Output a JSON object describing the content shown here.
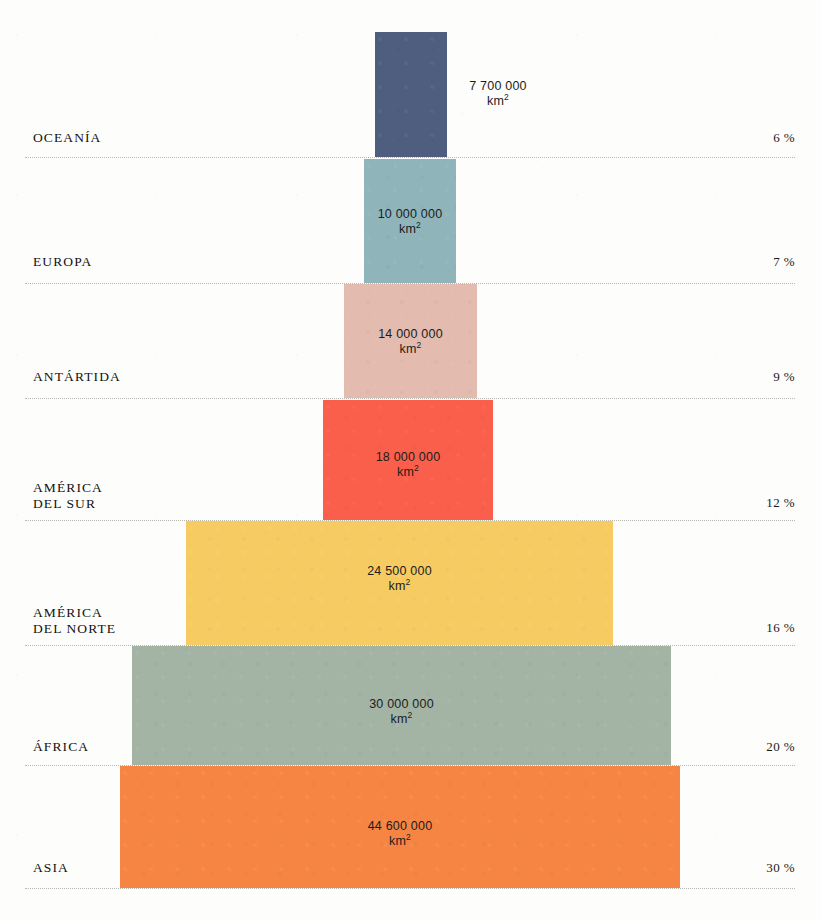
{
  "chart_data": {
    "type": "bar",
    "title": "",
    "subtitle": "",
    "xlabel": "",
    "ylabel": "",
    "orientation": "horizontal-centered-pyramid",
    "unit": "km²",
    "legend_position": "none",
    "grid": "horizontal dotted separators between rows",
    "categories": [
      "OCEANÍA",
      "EUROPA",
      "ANTÁRTIDA",
      "AMÉRICA DEL SUR",
      "AMÉRICA DEL NORTE",
      "ÁFRICA",
      "ASIA"
    ],
    "values": [
      7700000,
      10000000,
      14000000,
      18000000,
      24500000,
      30000000,
      44600000
    ],
    "percentages": [
      6,
      7,
      9,
      12,
      16,
      20,
      30
    ],
    "value_labels": [
      "7 700 000",
      "10 000 000",
      "14 000 000",
      "18 000 000",
      "24 500 000",
      "30 000 000",
      "44 600 000"
    ],
    "percent_labels": [
      "6 %",
      "7 %",
      "9 %",
      "12 %",
      "16 %",
      "20 %",
      "30 %"
    ],
    "colors": [
      "#4f5e7e",
      "#8fb4b9",
      "#e3bbaf",
      "#f95f4b",
      "#f6cc62",
      "#a3b3a4",
      "#f68544"
    ]
  },
  "rows": [
    {
      "name": "OCEANÍA",
      "label": "OCEANÍA",
      "value_label": "7 700 000",
      "unit": "km",
      "unit_exp": "2",
      "percent_label": "6 %",
      "color": "#4f5e7e",
      "bar": {
        "left": 375,
        "top": 32,
        "width": 72,
        "height": 125
      },
      "value_pos": {
        "left": 455,
        "top": 79,
        "width": 86
      },
      "value_inside": false,
      "label_top": 130,
      "pct_top": 130,
      "line_y": 157
    },
    {
      "name": "EUROPA",
      "label": "EUROPA",
      "value_label": "10 000 000",
      "unit": "km",
      "unit_exp": "2",
      "percent_label": "7 %",
      "color": "#8fb4b9",
      "bar": {
        "left": 364,
        "top": 159,
        "width": 92,
        "height": 124
      },
      "value_pos": {
        "left": 364,
        "top": 207,
        "width": 92
      },
      "value_inside": true,
      "label_top": 254,
      "pct_top": 254,
      "line_y": 283
    },
    {
      "name": "ANTÁRTIDA",
      "label": "ANTÁRTIDA",
      "value_label": "14 000 000",
      "unit": "km",
      "unit_exp": "2",
      "percent_label": "9 %",
      "color": "#e3bbaf",
      "bar": {
        "left": 344,
        "top": 284,
        "width": 133,
        "height": 114
      },
      "value_pos": {
        "left": 344,
        "top": 327,
        "width": 133
      },
      "value_inside": true,
      "label_top": 369,
      "pct_top": 369,
      "line_y": 398
    },
    {
      "name": "AMÉRICA DEL SUR",
      "label": "AMÉRICA\nDEL SUR",
      "value_label": "18 000 000",
      "unit": "km",
      "unit_exp": "2",
      "percent_label": "12 %",
      "color": "#f95f4b",
      "bar": {
        "left": 323,
        "top": 400,
        "width": 170,
        "height": 120
      },
      "value_pos": {
        "left": 323,
        "top": 450,
        "width": 170
      },
      "value_inside": true,
      "label_top": 480,
      "pct_top": 495,
      "line_y": 520
    },
    {
      "name": "AMÉRICA DEL NORTE",
      "label": "AMÉRICA\nDEL NORTE",
      "value_label": "24 500 000",
      "unit": "km",
      "unit_exp": "2",
      "percent_label": "16 %",
      "color": "#f6cc62",
      "bar": {
        "left": 186,
        "top": 521,
        "width": 427,
        "height": 124
      },
      "value_pos": {
        "left": 186,
        "top": 564,
        "width": 427
      },
      "value_inside": true,
      "label_top": 605,
      "pct_top": 620,
      "line_y": 645
    },
    {
      "name": "ÁFRICA",
      "label": "ÁFRICA",
      "value_label": "30 000 000",
      "unit": "km",
      "unit_exp": "2",
      "percent_label": "20 %",
      "color": "#a3b3a4",
      "bar": {
        "left": 132,
        "top": 646,
        "width": 539,
        "height": 119
      },
      "value_pos": {
        "left": 132,
        "top": 697,
        "width": 539
      },
      "value_inside": true,
      "label_top": 739,
      "pct_top": 739,
      "line_y": 765
    },
    {
      "name": "ASIA",
      "label": "ASIA",
      "value_label": "44 600 000",
      "unit": "km",
      "unit_exp": "2",
      "percent_label": "30 %",
      "color": "#f68544",
      "bar": {
        "left": 120,
        "top": 766,
        "width": 560,
        "height": 122
      },
      "value_pos": {
        "left": 120,
        "top": 819,
        "width": 560
      },
      "value_inside": true,
      "label_top": 860,
      "pct_top": 860,
      "line_y": 888
    }
  ]
}
